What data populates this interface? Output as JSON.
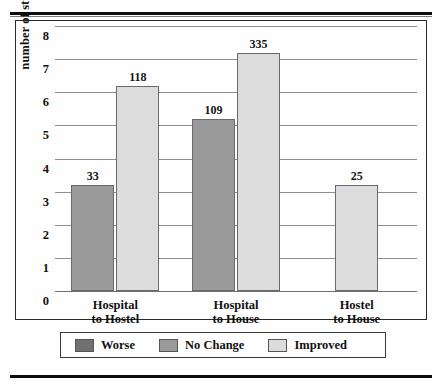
{
  "figure": {
    "y_axis_title": "number of studies"
  },
  "chart_data": {
    "type": "bar",
    "title": "",
    "xlabel": "",
    "ylabel": "number of studies",
    "ylim": [
      0,
      8
    ],
    "ytick_labels": [
      "0",
      "1",
      "2",
      "3",
      "4",
      "5",
      "6",
      "7",
      "8"
    ],
    "ytick_values": [
      0,
      1,
      2,
      3,
      4,
      5,
      6,
      7,
      8
    ],
    "grid": true,
    "legend_position": "bottom",
    "categories": [
      "Hospital to Hostel",
      "Hospital to House",
      "Hostel to House"
    ],
    "category_lines": [
      [
        "Hospital",
        "to Hostel"
      ],
      [
        "Hospital",
        "to House"
      ],
      [
        "Hostel",
        "to House"
      ]
    ],
    "series": [
      {
        "name": "Worse",
        "color": "#707070",
        "values": [
          null,
          null,
          null
        ],
        "labels": [
          "",
          "",
          ""
        ]
      },
      {
        "name": "No Change",
        "color": "#9a9a9a",
        "values": [
          3.2,
          5.2,
          null
        ],
        "labels": [
          "33",
          "109",
          ""
        ]
      },
      {
        "name": "Improved",
        "color": "#dcdcdc",
        "values": [
          6.2,
          7.2,
          3.2
        ],
        "labels": [
          "118",
          "335",
          "25"
        ]
      }
    ],
    "bars": [
      {
        "group": "Hospital to Hostel",
        "series": "No Change",
        "value": 3.2,
        "label": "33",
        "color": "#9a9a9a"
      },
      {
        "group": "Hospital to Hostel",
        "series": "Improved",
        "value": 6.2,
        "label": "118",
        "color": "#dcdcdc"
      },
      {
        "group": "Hospital to House",
        "series": "No Change",
        "value": 5.2,
        "label": "109",
        "color": "#9a9a9a"
      },
      {
        "group": "Hospital to House",
        "series": "Improved",
        "value": 7.2,
        "label": "335",
        "color": "#dcdcdc"
      },
      {
        "group": "Hostel to House",
        "series": "Improved",
        "value": 3.2,
        "label": "25",
        "color": "#dcdcdc"
      }
    ],
    "legend": [
      {
        "label": "Worse",
        "color": "#707070"
      },
      {
        "label": "No Change",
        "color": "#9a9a9a"
      },
      {
        "label": "Improved",
        "color": "#dcdcdc"
      }
    ]
  }
}
